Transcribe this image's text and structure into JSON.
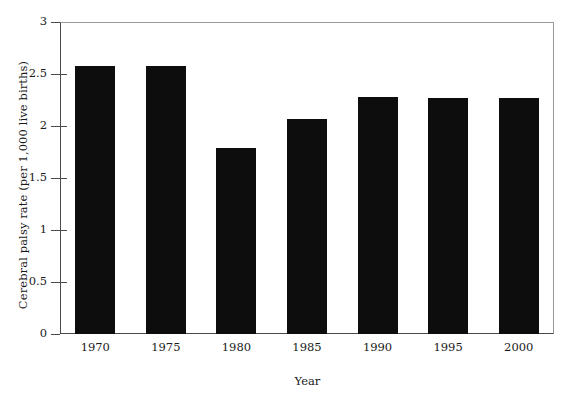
{
  "chart_data": {
    "type": "bar",
    "title": "",
    "xlabel": "Year",
    "ylabel": "Cerebral palsy rate (per 1,000 live births)",
    "categories": [
      "1970",
      "1975",
      "1980",
      "1985",
      "1990",
      "1995",
      "2000"
    ],
    "values": [
      2.58,
      2.58,
      1.79,
      2.07,
      2.28,
      2.27,
      2.27
    ],
    "ylim": [
      0,
      3
    ],
    "yticks": [
      "0",
      "0.5",
      "1",
      "1.5",
      "2",
      "2.5",
      "3"
    ],
    "ytick_values": [
      0,
      0.5,
      1,
      1.5,
      2,
      2.5,
      3
    ],
    "grid": false,
    "legend": false,
    "bar_color": "#0d0d0d",
    "axis_color": "#4a4a4a",
    "frame_color": "#9a9a9a",
    "background": "#ffffff"
  }
}
